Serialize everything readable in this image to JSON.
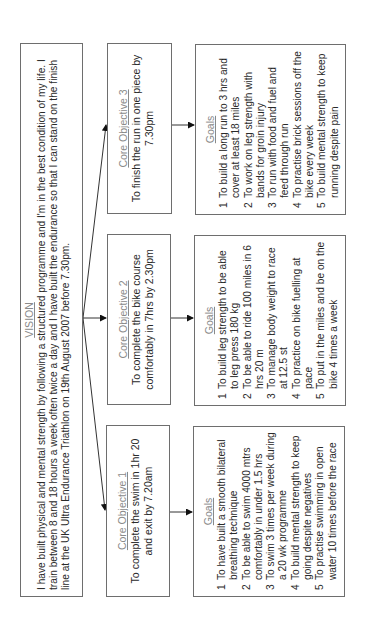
{
  "vision": {
    "title": "VISION",
    "text": "I have built physical and mental strength by following a structured programme and I'm in the best condition of my life. I train between 8 and 18 hours a week often twice a day and I have built the endurance so that I can stand on the finish line at the UK Ultra Endurance Triathlon on 19th August 2007 before 7.30pm."
  },
  "objectives": [
    {
      "title": "Core Objective 1",
      "text": "To complete the swim in 1hr 20 and exit by 7.20am",
      "goals_title": "Goals",
      "goals": [
        {
          "num": "1",
          "text": "To have built a smooth bilateral breathing technique"
        },
        {
          "num": "2",
          "text": "To be able to swim 4000 mtrs comfortably in under 1.5 hrs"
        },
        {
          "num": "3",
          "text": "To swim 3 times per week during a 20 wk programme"
        },
        {
          "num": "4",
          "text": "To build mental strength to keep going despite negatives"
        },
        {
          "num": "5",
          "text": "To practise swimming in open water 10 times before the race"
        }
      ]
    },
    {
      "title": "Core Objective 2",
      "text": "To complete the bike course comfortably in 7hrs by 2.30pm",
      "goals_title": "Goals",
      "goals": [
        {
          "num": "1",
          "text": "To build leg strength to be able to leg press 180 kg"
        },
        {
          "num": "2",
          "text": "To be able to ride 100 miles in 6 hrs 20 m"
        },
        {
          "num": "3",
          "text": "To manage body weight to race at 12.5 st"
        },
        {
          "num": "4",
          "text": "To practice on bike fuelling at pace"
        },
        {
          "num": "5",
          "text": "To put in the miles and be on the bike 4 times a week"
        }
      ]
    },
    {
      "title": "Core Objective 3",
      "text": "To finish the run in one piece by 7.30pm",
      "goals_title": "Goals",
      "goals": [
        {
          "num": "1",
          "text": "To build a long run to 3 hrs and cover at least 18 miles"
        },
        {
          "num": "2",
          "text": "To work on leg strength with bands for groin injury"
        },
        {
          "num": "3",
          "text": "To run with food and fuel and feed through run"
        },
        {
          "num": "4",
          "text": "To practise brick sessions off the bike every week"
        },
        {
          "num": "5",
          "text": "To build mental strength to keep running despite pain"
        }
      ]
    }
  ]
}
